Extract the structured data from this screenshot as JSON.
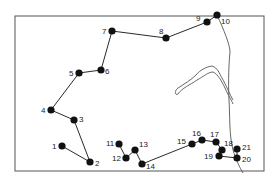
{
  "diagram": {
    "frame": {
      "x": 15,
      "y": 16,
      "width": 249,
      "height": 155
    },
    "colors": {
      "ink": "#111111",
      "frame": "#555555",
      "coast": "#555555",
      "label": "#222222"
    },
    "points": [
      {
        "id": "1",
        "x": 62,
        "y": 146,
        "lx": -10,
        "ly": 3
      },
      {
        "id": "2",
        "x": 90,
        "y": 162,
        "lx": 5,
        "ly": 4
      },
      {
        "id": "3",
        "x": 74,
        "y": 120,
        "lx": 5,
        "ly": 2
      },
      {
        "id": "4",
        "x": 51,
        "y": 110,
        "lx": -10,
        "ly": 3
      },
      {
        "id": "5",
        "x": 79,
        "y": 73,
        "lx": -10,
        "ly": 3
      },
      {
        "id": "6",
        "x": 101,
        "y": 70,
        "lx": 4,
        "ly": 4
      },
      {
        "id": "7",
        "x": 112,
        "y": 31,
        "lx": -10,
        "ly": 3
      },
      {
        "id": "8",
        "x": 166,
        "y": 38,
        "lx": -7,
        "ly": -4
      },
      {
        "id": "9",
        "x": 207,
        "y": 22,
        "lx": -11,
        "ly": -1
      },
      {
        "id": "10",
        "x": 217,
        "y": 15,
        "lx": 4,
        "ly": 9
      },
      {
        "id": "11",
        "x": 119,
        "y": 144,
        "lx": -13,
        "ly": 2
      },
      {
        "id": "12",
        "x": 126,
        "y": 158,
        "lx": -14,
        "ly": 3
      },
      {
        "id": "13",
        "x": 135,
        "y": 150,
        "lx": 4,
        "ly": -3
      },
      {
        "id": "14",
        "x": 142,
        "y": 164,
        "lx": 4,
        "ly": 5
      },
      {
        "id": "15",
        "x": 192,
        "y": 144,
        "lx": -15,
        "ly": 0
      },
      {
        "id": "16",
        "x": 202,
        "y": 140,
        "lx": -10,
        "ly": -4
      },
      {
        "id": "17",
        "x": 216,
        "y": 142,
        "lx": -6,
        "ly": -5
      },
      {
        "id": "18",
        "x": 222,
        "y": 150,
        "lx": 2,
        "ly": -4
      },
      {
        "id": "19",
        "x": 219,
        "y": 156,
        "lx": -15,
        "ly": 3
      },
      {
        "id": "20",
        "x": 237,
        "y": 158,
        "lx": 5,
        "ly": 4
      },
      {
        "id": "21",
        "x": 237,
        "y": 149,
        "lx": 5,
        "ly": 1
      }
    ],
    "paths": [
      [
        "1",
        "2",
        "3",
        "4",
        "5",
        "6",
        "7",
        "8",
        "9",
        "10"
      ],
      [
        "11",
        "12",
        "13",
        "14",
        "15",
        "16",
        "17",
        "18",
        "19",
        "20",
        "21"
      ]
    ],
    "coastline": "M217,15 C224,30 230,45 230,52 C229,62 228,80 229,100 C230,115 229,135 233,150 C236,160 240,168 243,173",
    "inlet": "M233,100 C230,95 226,85 222,78 C219,73 218,68 212,66 C206,67 200,70 196,75 C191,80 184,84 178,88 C174,91 175,96 178,94 C182,88 190,85 197,80 C203,77 208,72 213,72 C218,74 222,82 225,88 C228,95 232,101 233,104"
  }
}
